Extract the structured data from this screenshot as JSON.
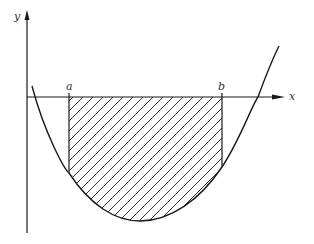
{
  "diagram": {
    "labels": {
      "y_axis": "y",
      "x_axis": "x",
      "a": "a",
      "b": "b"
    },
    "colors": {
      "stroke": "#1a1a1a",
      "background": "#ffffff"
    },
    "shaded_region": "between x = a and x = b, below the x-axis and above the curve"
  }
}
